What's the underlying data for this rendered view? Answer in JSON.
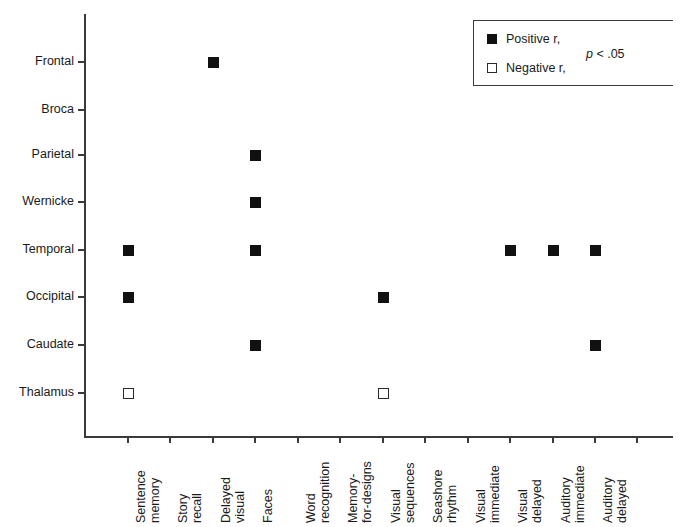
{
  "chart_data": {
    "type": "scatter",
    "title": "",
    "xlabel": "",
    "ylabel": "",
    "grid": false,
    "categories_y": [
      "Frontal",
      "Broca",
      "Parietal",
      "Wernicke",
      "Temporal",
      "Occipital",
      "Caudate",
      "Thalamus"
    ],
    "categories_x": [
      "Sentence memory",
      "Story recall",
      "Delayed visual",
      "Faces",
      "Word recognition",
      "Memory-for-designs",
      "Visual sequences",
      "Seashore rhythm",
      "Visual immediate",
      "Visual delayed",
      "Auditory immediate",
      "Auditory delayed"
    ],
    "x_tick_count": 13,
    "points": [
      {
        "x": "Delayed visual",
        "y": "Frontal",
        "sign": "positive"
      },
      {
        "x": "Faces",
        "y": "Parietal",
        "sign": "positive"
      },
      {
        "x": "Faces",
        "y": "Wernicke",
        "sign": "positive"
      },
      {
        "x": "Sentence memory",
        "y": "Temporal",
        "sign": "positive"
      },
      {
        "x": "Faces",
        "y": "Temporal",
        "sign": "positive"
      },
      {
        "x": "Visual delayed",
        "y": "Temporal",
        "sign": "positive"
      },
      {
        "x": "Auditory immediate",
        "y": "Temporal",
        "sign": "positive"
      },
      {
        "x": "Auditory delayed",
        "y": "Temporal",
        "sign": "positive"
      },
      {
        "x": "Sentence memory",
        "y": "Occipital",
        "sign": "positive"
      },
      {
        "x": "Visual sequences",
        "y": "Occipital",
        "sign": "positive"
      },
      {
        "x": "Faces",
        "y": "Caudate",
        "sign": "positive"
      },
      {
        "x": "Auditory delayed",
        "y": "Caudate",
        "sign": "positive"
      },
      {
        "x": "Sentence memory",
        "y": "Thalamus",
        "sign": "negative"
      },
      {
        "x": "Visual sequences",
        "y": "Thalamus",
        "sign": "negative"
      }
    ],
    "legend": {
      "position": "top-right",
      "positive_label": "Positive r,",
      "negative_label": "Negative r,",
      "pvalue_italic": "p",
      "pvalue_rest": " < .05"
    }
  },
  "x_axis_labels": [
    {
      "line1": "Sentence",
      "line2": "memory"
    },
    {
      "line1": "Story",
      "line2": "recall"
    },
    {
      "line1": "Delayed",
      "line2": "visual"
    },
    {
      "line1": "Faces",
      "line2": ""
    },
    {
      "line1": "Word",
      "line2": "recognition"
    },
    {
      "line1": "Memory-",
      "line2": "for-designs"
    },
    {
      "line1": "Visual",
      "line2": "sequences"
    },
    {
      "line1": "Seashore",
      "line2": "rhythm"
    },
    {
      "line1": "Visual",
      "line2": "immediate"
    },
    {
      "line1": "Visual",
      "line2": "delayed"
    },
    {
      "line1": "Auditory",
      "line2": "immediate"
    },
    {
      "line1": "Auditory",
      "line2": "delayed"
    }
  ],
  "y_axis_labels": [
    "Frontal",
    "Broca",
    "Parietal",
    "Wernicke",
    "Temporal",
    "Occipital",
    "Caudate",
    "Thalamus"
  ],
  "legend": {
    "positive_label": "Positive r,",
    "negative_label": "Negative r,",
    "p_symbol": "p",
    "p_rest": " < .05"
  },
  "colors": {
    "marker_fill": "#111111",
    "marker_stroke": "#2b2b2b",
    "axis": "#3a3a3a",
    "background": "#ffffff",
    "text": "#1a1a1a"
  },
  "geometry": {
    "y_positions": [
      62,
      110,
      155,
      202,
      250,
      297,
      345,
      393
    ],
    "x_positions": [
      128,
      170,
      213,
      255,
      298,
      340,
      383,
      425,
      468,
      510,
      553,
      595,
      637
    ]
  }
}
